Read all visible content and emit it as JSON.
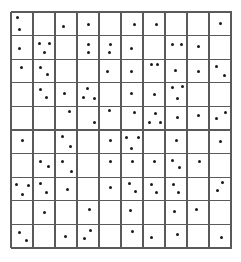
{
  "grid": {
    "rows": 10,
    "cols": 10,
    "origin_x": 11,
    "origin_y": 12,
    "width": 220,
    "height": 236,
    "line_color": "#5a5a5a",
    "dot_color": "#1a1a1a"
  },
  "dots": [
    [
      17,
      17
    ],
    [
      19,
      29
    ],
    [
      63,
      26
    ],
    [
      88,
      24
    ],
    [
      134,
      24
    ],
    [
      156,
      24
    ],
    [
      220,
      23
    ],
    [
      19,
      48
    ],
    [
      39,
      43
    ],
    [
      49,
      43
    ],
    [
      44,
      52
    ],
    [
      88,
      44
    ],
    [
      88,
      52
    ],
    [
      110,
      44
    ],
    [
      109,
      52
    ],
    [
      131,
      48
    ],
    [
      172,
      44
    ],
    [
      181,
      44
    ],
    [
      198,
      46
    ],
    [
      21,
      67
    ],
    [
      40,
      67
    ],
    [
      47,
      74
    ],
    [
      107,
      71
    ],
    [
      131,
      71
    ],
    [
      151,
      64
    ],
    [
      157,
      64
    ],
    [
      175,
      70
    ],
    [
      198,
      71
    ],
    [
      216,
      66
    ],
    [
      224,
      75
    ],
    [
      40,
      89
    ],
    [
      46,
      97
    ],
    [
      64,
      93
    ],
    [
      87,
      88
    ],
    [
      83,
      97
    ],
    [
      94,
      98
    ],
    [
      131,
      93
    ],
    [
      154,
      94
    ],
    [
      172,
      87
    ],
    [
      182,
      86
    ],
    [
      177,
      98
    ],
    [
      69,
      111
    ],
    [
      94,
      122
    ],
    [
      109,
      110
    ],
    [
      134,
      112
    ],
    [
      155,
      113
    ],
    [
      149,
      122
    ],
    [
      160,
      122
    ],
    [
      177,
      117
    ],
    [
      198,
      115
    ],
    [
      216,
      118
    ],
    [
      225,
      112
    ],
    [
      22,
      140
    ],
    [
      62,
      136
    ],
    [
      70,
      146
    ],
    [
      110,
      140
    ],
    [
      126,
      137
    ],
    [
      138,
      137
    ],
    [
      131,
      148
    ],
    [
      176,
      140
    ],
    [
      220,
      141
    ],
    [
      40,
      161
    ],
    [
      48,
      166
    ],
    [
      62,
      161
    ],
    [
      71,
      171
    ],
    [
      110,
      161
    ],
    [
      132,
      161
    ],
    [
      154,
      161
    ],
    [
      172,
      160
    ],
    [
      179,
      167
    ],
    [
      199,
      161
    ],
    [
      16,
      184
    ],
    [
      28,
      185
    ],
    [
      22,
      194
    ],
    [
      40,
      183
    ],
    [
      46,
      192
    ],
    [
      67,
      189
    ],
    [
      110,
      187
    ],
    [
      129,
      183
    ],
    [
      135,
      191
    ],
    [
      151,
      184
    ],
    [
      156,
      192
    ],
    [
      173,
      184
    ],
    [
      178,
      192
    ],
    [
      222,
      182
    ],
    [
      217,
      190
    ],
    [
      44,
      212
    ],
    [
      89,
      209
    ],
    [
      130,
      210
    ],
    [
      174,
      211
    ],
    [
      196,
      209
    ],
    [
      19,
      232
    ],
    [
      26,
      240
    ],
    [
      65,
      236
    ],
    [
      90,
      230
    ],
    [
      84,
      238
    ],
    [
      132,
      231
    ],
    [
      151,
      237
    ],
    [
      177,
      234
    ],
    [
      221,
      237
    ]
  ]
}
